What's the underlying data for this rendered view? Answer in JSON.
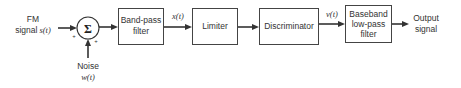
{
  "diagram": {
    "inputs": {
      "fm_signal": {
        "line1": "FM",
        "line2": "signal",
        "symbol": "s(t)"
      },
      "noise": {
        "line1": "Noise",
        "symbol": "w(t)"
      }
    },
    "summer": {
      "symbol": "Σ",
      "sign_left": "+",
      "sign_bottom": "+"
    },
    "blocks": [
      {
        "id": "band-pass-filter",
        "lines": [
          "Band-pass",
          "filter"
        ]
      },
      {
        "id": "limiter",
        "lines": [
          "Limiter"
        ]
      },
      {
        "id": "discriminator",
        "lines": [
          "Discriminator"
        ]
      },
      {
        "id": "baseband-low-pass-filter",
        "lines": [
          "Baseband",
          "low-pass",
          "filter"
        ]
      }
    ],
    "edge_labels": {
      "bpf_out": "x(t)",
      "disc_out": "v(t)"
    },
    "output": {
      "line1": "Output",
      "line2": "signal"
    }
  }
}
